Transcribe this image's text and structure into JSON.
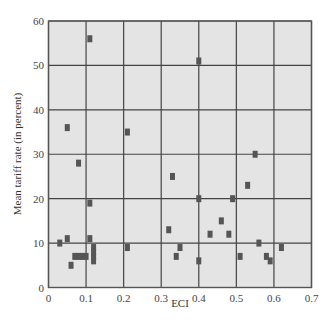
{
  "chart_data": {
    "type": "scatter",
    "title": "",
    "xlabel": "ECI",
    "ylabel": "Mean tariff rate (in percent)",
    "xlim": [
      0,
      0.7
    ],
    "ylim": [
      0,
      60
    ],
    "xticks": [
      "0",
      "0.1",
      "0.2",
      "0.3",
      "0.4",
      "0.5",
      "0.6",
      "0.7"
    ],
    "yticks": [
      "0",
      "10",
      "20",
      "30",
      "40",
      "50",
      "60"
    ],
    "grid": true,
    "legend": null,
    "marker_color": "#555555",
    "plot_bg": "#e4e4e4",
    "grid_color": "#444444",
    "series": [
      {
        "name": "Countries",
        "points": [
          {
            "x": 0.11,
            "y": 56
          },
          {
            "x": 0.4,
            "y": 51
          },
          {
            "x": 0.05,
            "y": 36
          },
          {
            "x": 0.21,
            "y": 35
          },
          {
            "x": 0.55,
            "y": 30
          },
          {
            "x": 0.08,
            "y": 28
          },
          {
            "x": 0.33,
            "y": 25
          },
          {
            "x": 0.53,
            "y": 23
          },
          {
            "x": 0.4,
            "y": 20
          },
          {
            "x": 0.49,
            "y": 20
          },
          {
            "x": 0.11,
            "y": 19
          },
          {
            "x": 0.46,
            "y": 15
          },
          {
            "x": 0.32,
            "y": 13
          },
          {
            "x": 0.43,
            "y": 12
          },
          {
            "x": 0.48,
            "y": 12
          },
          {
            "x": 0.05,
            "y": 11
          },
          {
            "x": 0.11,
            "y": 11
          },
          {
            "x": 0.03,
            "y": 10
          },
          {
            "x": 0.56,
            "y": 10
          },
          {
            "x": 0.21,
            "y": 9
          },
          {
            "x": 0.35,
            "y": 9
          },
          {
            "x": 0.62,
            "y": 9
          },
          {
            "x": 0.12,
            "y": 9
          },
          {
            "x": 0.12,
            "y": 8
          },
          {
            "x": 0.07,
            "y": 7
          },
          {
            "x": 0.08,
            "y": 7
          },
          {
            "x": 0.09,
            "y": 7
          },
          {
            "x": 0.1,
            "y": 7
          },
          {
            "x": 0.12,
            "y": 7
          },
          {
            "x": 0.34,
            "y": 7
          },
          {
            "x": 0.51,
            "y": 7
          },
          {
            "x": 0.58,
            "y": 7
          },
          {
            "x": 0.12,
            "y": 6
          },
          {
            "x": 0.4,
            "y": 6
          },
          {
            "x": 0.59,
            "y": 6
          },
          {
            "x": 0.06,
            "y": 5
          }
        ]
      }
    ]
  }
}
